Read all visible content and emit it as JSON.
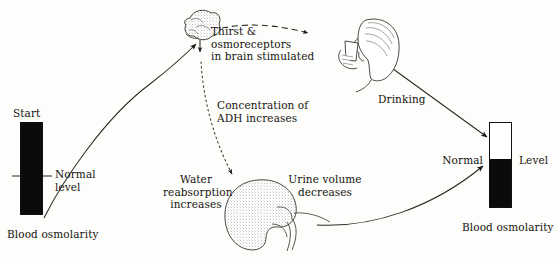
{
  "diagram": {
    "ink_color": "#16140f",
    "fill_color": "#0b0b0b",
    "background": "#fdfdfb"
  },
  "left_gauge": {
    "top_label": "Start",
    "normal_label": "Normal\nlevel",
    "caption": "Blood osmolarity",
    "fill_percent": 100
  },
  "right_gauge": {
    "normal_label": "Normal",
    "level_label": "Level",
    "caption": "Blood osmolarity",
    "fill_percent": 56
  },
  "nodes": {
    "brain": {
      "icon": "brain-icon",
      "label": "Thirst &\nosmoreceptors\nin brain stimulated"
    },
    "drinking": {
      "icon": "person-drinking-icon",
      "label": "Drinking"
    },
    "kidney": {
      "icon": "kidney-icon",
      "label_left": "Water\nreabsorption\nincreases",
      "label_right": "Urine volume\ndecreases"
    }
  },
  "annotations": {
    "adh": "Concentration of\nADH increases"
  }
}
